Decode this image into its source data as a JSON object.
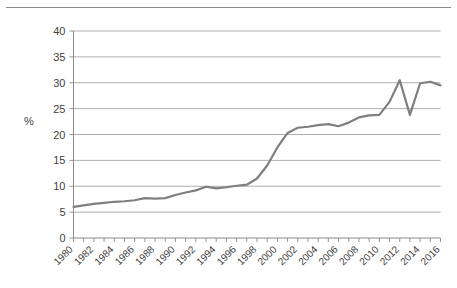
{
  "figure": {
    "name": "line-chart-percentage-by-year",
    "unit_label": "%"
  },
  "chart_data": {
    "type": "line",
    "title": "",
    "subtitle": "",
    "xlabel": "",
    "ylabel": "%",
    "grid": true,
    "legend": "none",
    "xlim": [
      1980,
      2016
    ],
    "ylim": [
      0,
      40
    ],
    "yticks": [
      0,
      5,
      10,
      15,
      20,
      25,
      30,
      35,
      40
    ],
    "ytick_labels": [
      "0",
      "5",
      "10",
      "15",
      "20",
      "25",
      "30",
      "35",
      "40"
    ],
    "xticks": [
      1980,
      1982,
      1984,
      1986,
      1988,
      1990,
      1992,
      1994,
      1996,
      1998,
      2000,
      2002,
      2004,
      2006,
      2008,
      2010,
      2012,
      2014,
      2016
    ],
    "xtick_labels": [
      "1980",
      "1982",
      "1984",
      "1986",
      "1988",
      "1990",
      "1992",
      "1994",
      "1996",
      "1998",
      "2000",
      "2002",
      "2004",
      "2006",
      "2008",
      "2010",
      "2012",
      "2014",
      "2016"
    ],
    "line_color": "#7f7f7f",
    "grid_color": "#9a9a9a",
    "series": [
      {
        "name": "percentage",
        "x": [
          1980,
          1981,
          1982,
          1983,
          1984,
          1985,
          1986,
          1987,
          1988,
          1989,
          1990,
          1991,
          1992,
          1993,
          1994,
          1995,
          1996,
          1997,
          1998,
          1999,
          2000,
          2001,
          2002,
          2003,
          2004,
          2005,
          2006,
          2007,
          2008,
          2009,
          2010,
          2011,
          2012,
          2013,
          2014,
          2015,
          2016
        ],
        "values": [
          6.0,
          6.3,
          6.6,
          6.8,
          7.0,
          7.1,
          7.3,
          7.7,
          7.6,
          7.7,
          8.3,
          8.8,
          9.2,
          9.9,
          9.6,
          9.8,
          10.1,
          10.3,
          11.5,
          14.0,
          17.5,
          20.3,
          21.3,
          21.5,
          21.8,
          22.0,
          21.6,
          22.3,
          23.3,
          23.7,
          23.8,
          26.3,
          30.5,
          23.8,
          29.9,
          30.2,
          29.5
        ]
      }
    ],
    "data_points": [
      {
        "year": 1980,
        "value": 6.0
      },
      {
        "year": 1981,
        "value": 6.3
      },
      {
        "year": 1982,
        "value": 6.6
      },
      {
        "year": 1983,
        "value": 6.8
      },
      {
        "year": 1984,
        "value": 7.0
      },
      {
        "year": 1985,
        "value": 7.1
      },
      {
        "year": 1986,
        "value": 7.3
      },
      {
        "year": 1987,
        "value": 7.7
      },
      {
        "year": 1988,
        "value": 7.6
      },
      {
        "year": 1989,
        "value": 7.7
      },
      {
        "year": 1990,
        "value": 8.3
      },
      {
        "year": 1991,
        "value": 8.8
      },
      {
        "year": 1992,
        "value": 9.2
      },
      {
        "year": 1993,
        "value": 9.9
      },
      {
        "year": 1994,
        "value": 9.6
      },
      {
        "year": 1995,
        "value": 9.8
      },
      {
        "year": 1996,
        "value": 10.1
      },
      {
        "year": 1997,
        "value": 10.3
      },
      {
        "year": 1998,
        "value": 11.5
      },
      {
        "year": 1999,
        "value": 14.0
      },
      {
        "year": 2000,
        "value": 17.5
      },
      {
        "year": 2001,
        "value": 20.3
      },
      {
        "year": 2002,
        "value": 21.3
      },
      {
        "year": 2003,
        "value": 21.5
      },
      {
        "year": 2004,
        "value": 21.8
      },
      {
        "year": 2005,
        "value": 22.0
      },
      {
        "year": 2006,
        "value": 21.6
      },
      {
        "year": 2007,
        "value": 22.3
      },
      {
        "year": 2008,
        "value": 23.3
      },
      {
        "year": 2009,
        "value": 23.7
      },
      {
        "year": 2010,
        "value": 23.8
      },
      {
        "year": 2011,
        "value": 26.3
      },
      {
        "year": 2012,
        "value": 30.5
      },
      {
        "year": 2013,
        "value": 23.8
      },
      {
        "year": 2014,
        "value": 29.9
      },
      {
        "year": 2015,
        "value": 30.2
      },
      {
        "year": 2016,
        "value": 29.5
      }
    ]
  }
}
